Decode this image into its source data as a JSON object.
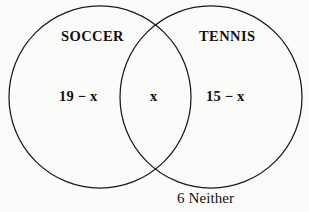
{
  "diagram": {
    "type": "venn-two-set",
    "background_color": "#fbfbfa",
    "stroke_color": "#1a1a1a",
    "text_color": "#111111",
    "sets": {
      "left": {
        "title": "SOCCER",
        "only_label": "19 − x"
      },
      "right": {
        "title": "TENNIS",
        "only_label": "15 − x"
      },
      "intersection": {
        "label": "x"
      },
      "outside": {
        "label": "6 Neither"
      }
    },
    "geometry": {
      "left_circle": {
        "cx": 100,
        "cy": 97,
        "r": 91
      },
      "right_circle": {
        "cx": 211,
        "cy": 97,
        "r": 91
      }
    }
  }
}
